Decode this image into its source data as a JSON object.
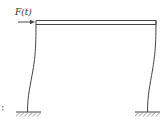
{
  "diagram": {
    "type": "portal-frame",
    "force": {
      "label": "F(t)",
      "direction": "right",
      "applied_at": "top-left-corner"
    },
    "beam": {
      "style": "double-line"
    },
    "columns": [
      {
        "side": "left",
        "shape": "deflected-curve"
      },
      {
        "side": "right",
        "shape": "deflected-curve"
      }
    ],
    "supports": [
      {
        "side": "left",
        "type": "fixed"
      },
      {
        "side": "right",
        "type": "fixed"
      }
    ],
    "colors": {
      "line": "#444444",
      "hatch": "#777777",
      "background": "#ffffff"
    }
  }
}
